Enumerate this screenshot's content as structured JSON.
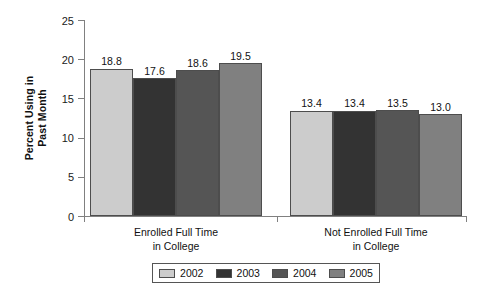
{
  "chart_data": {
    "type": "bar",
    "title": "",
    "subtitle": "",
    "xlabel": "",
    "ylabel": "Percent Using in Past Month",
    "ylabel_line1": "Percent Using in",
    "ylabel_line2": "Past Month",
    "ylim": [
      0,
      25
    ],
    "yticks": [
      0,
      5,
      10,
      15,
      20,
      25
    ],
    "ytick_labels": [
      "0",
      "5",
      "10",
      "15",
      "20",
      "25"
    ],
    "grid": false,
    "legend_position": "bottom",
    "categories": [
      "Enrolled Full Time in College",
      "Not Enrolled Full Time in College"
    ],
    "category_labels": [
      {
        "line1": "Enrolled Full Time",
        "line2": "in College"
      },
      {
        "line1": "Not Enrolled Full Time",
        "line2": "in College"
      }
    ],
    "series": [
      {
        "name": "2002",
        "color": "#cccccc",
        "values": [
          18.8,
          13.4
        ],
        "value_labels": [
          "18.8",
          "13.4"
        ]
      },
      {
        "name": "2003",
        "color": "#333333",
        "values": [
          17.6,
          13.4
        ],
        "value_labels": [
          "17.6",
          "13.4"
        ]
      },
      {
        "name": "2004",
        "color": "#555555",
        "values": [
          18.6,
          13.5
        ],
        "value_labels": [
          "18.6",
          "13.5"
        ]
      },
      {
        "name": "2005",
        "color": "#808080",
        "values": [
          19.5,
          13.0
        ],
        "value_labels": [
          "19.5",
          "13.0"
        ]
      }
    ],
    "legend": [
      {
        "label": "2002",
        "color": "#cccccc"
      },
      {
        "label": "2003",
        "color": "#333333"
      },
      {
        "label": "2004",
        "color": "#555555"
      },
      {
        "label": "2005",
        "color": "#808080"
      }
    ],
    "axis_color": "#808080",
    "bar_edge_color": "#4d4d4d",
    "background": "#ffffff"
  }
}
